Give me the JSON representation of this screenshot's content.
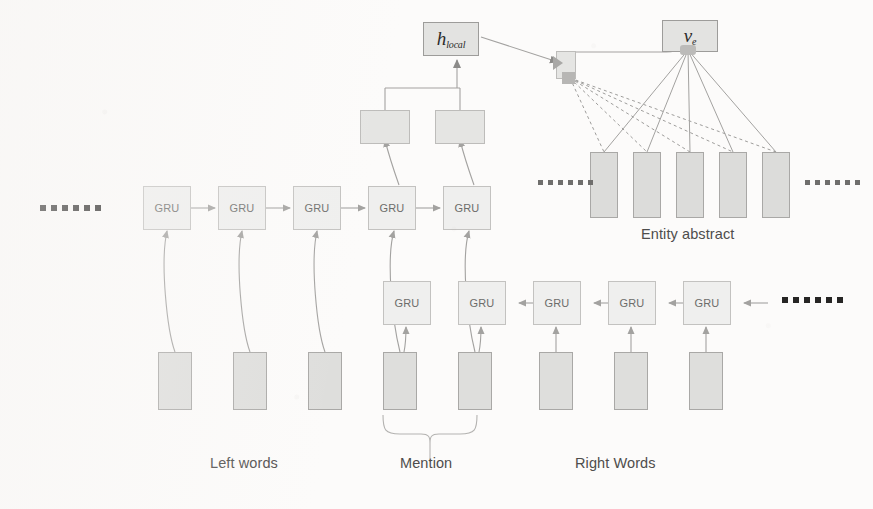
{
  "figure": {
    "background_color": "#fcfbfa",
    "node_fill": "#ececeb",
    "node_stroke": "#b9b8b6",
    "wire_color": "#9a9997"
  },
  "nodes": {
    "h_local": {
      "symbol": "h",
      "subscript": "local",
      "name": "h_local"
    },
    "v_e": {
      "symbol": "v",
      "subscript": "e",
      "name": "v_e"
    },
    "attention_cell": {
      "label": ""
    },
    "merge_left": {
      "label": ""
    },
    "merge_right": {
      "label": ""
    }
  },
  "forward_gru_row": {
    "direction": "left-to-right",
    "cells": [
      {
        "label": "GRU"
      },
      {
        "label": "GRU"
      },
      {
        "label": "GRU"
      },
      {
        "label": "GRU"
      },
      {
        "label": "GRU"
      }
    ]
  },
  "backward_gru_row": {
    "direction": "right-to-left",
    "cells": [
      {
        "label": "GRU"
      },
      {
        "label": "GRU"
      },
      {
        "label": "GRU"
      },
      {
        "label": "GRU"
      },
      {
        "label": "GRU"
      }
    ]
  },
  "word_boxes": {
    "left_words": [
      {
        "label": ""
      },
      {
        "label": ""
      },
      {
        "label": ""
      }
    ],
    "mention": [
      {
        "label": ""
      },
      {
        "label": ""
      }
    ],
    "right_words": [
      {
        "label": ""
      },
      {
        "label": ""
      },
      {
        "label": ""
      }
    ]
  },
  "entity_abstract": {
    "boxes": [
      {
        "label": ""
      },
      {
        "label": ""
      },
      {
        "label": ""
      },
      {
        "label": ""
      },
      {
        "label": ""
      }
    ],
    "caption": "Entity abstract"
  },
  "captions": {
    "left_words": "Left words",
    "mention": "Mention",
    "right_words": "Right Words"
  },
  "ellipses": {
    "far_left": {
      "dots": 6
    },
    "far_right_backward": {
      "dots": 6
    },
    "abstract_left": {
      "dots": 6
    },
    "abstract_right": {
      "dots": 6
    }
  }
}
